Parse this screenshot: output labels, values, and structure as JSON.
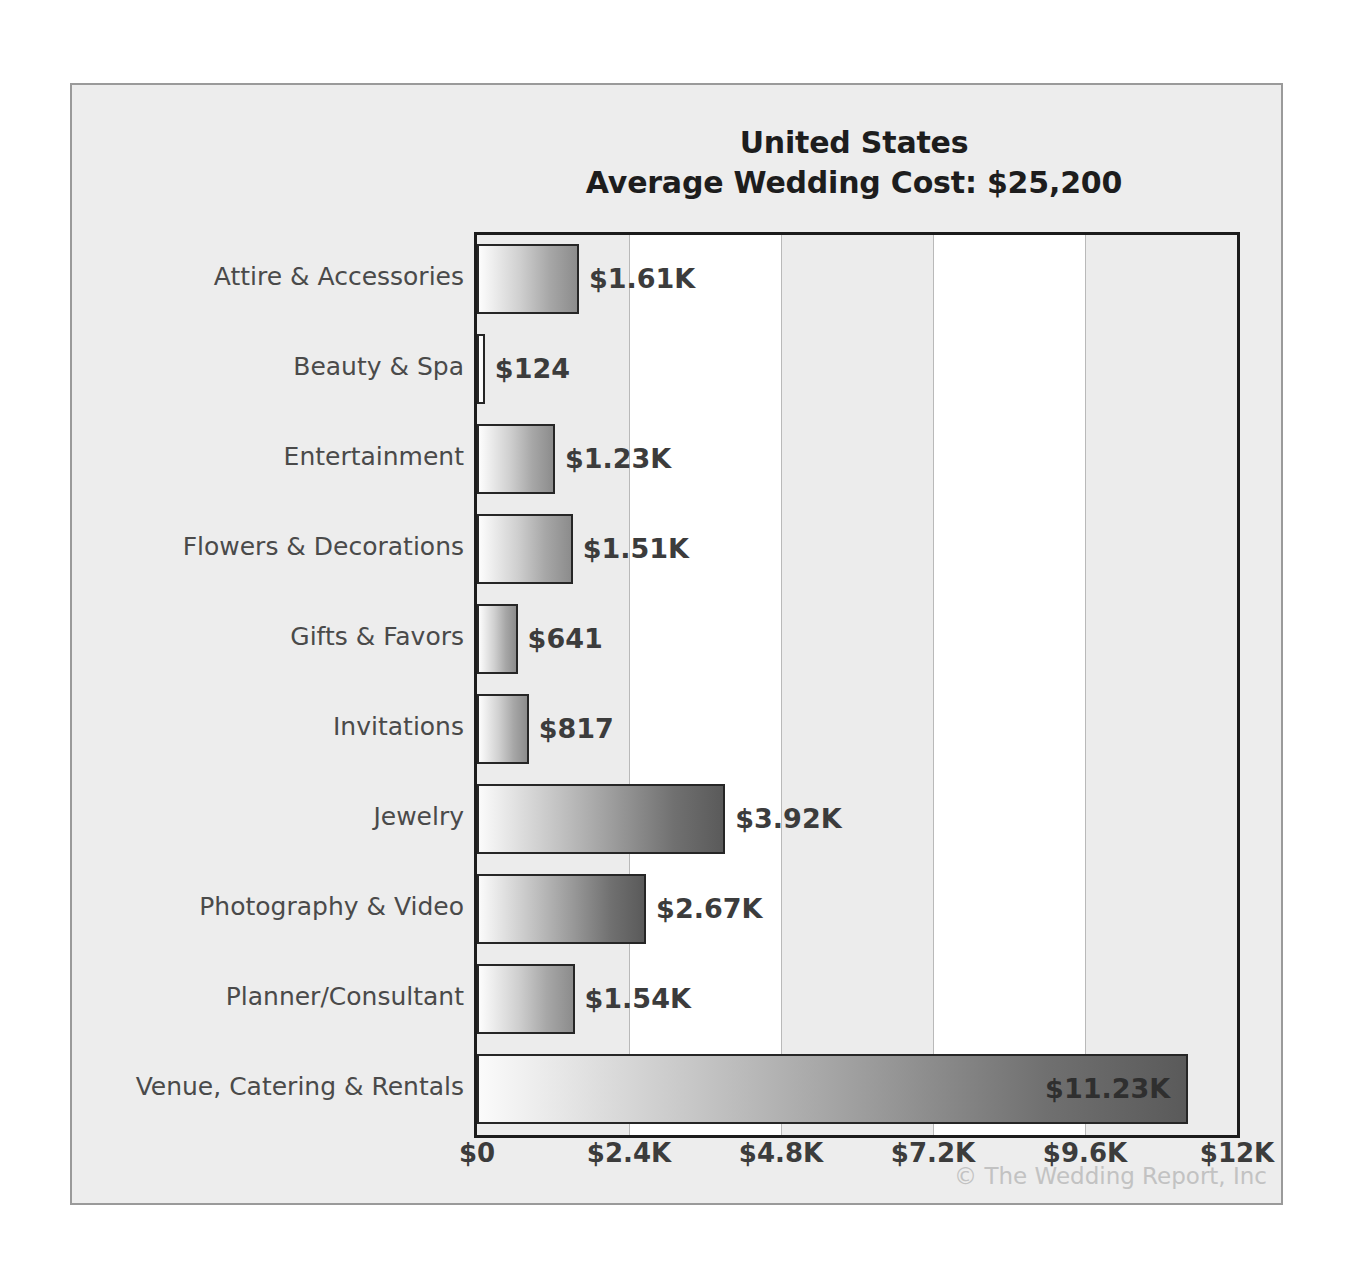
{
  "chart_data": {
    "type": "bar",
    "orientation": "horizontal",
    "title": "United States",
    "subtitle": "Average Wedding Cost: $25,200",
    "xlabel": "",
    "ylabel": "",
    "xlim": [
      0,
      12000
    ],
    "grid": true,
    "legend": null,
    "categories": [
      "Attire & Accessories",
      "Beauty & Spa",
      "Entertainment",
      "Flowers & Decorations",
      "Gifts & Favors",
      "Invitations",
      "Jewelry",
      "Photography & Video",
      "Planner/Consultant",
      "Venue, Catering & Rentals"
    ],
    "values": [
      1610,
      124,
      1230,
      1510,
      641,
      817,
      3920,
      2670,
      1540,
      11230
    ],
    "value_labels": [
      "$1.61K",
      "$124",
      "$1.23K",
      "$1.51K",
      "$641",
      "$817",
      "$3.92K",
      "$2.67K",
      "$1.54K",
      "$11.23K"
    ],
    "label_placement": [
      "outside",
      "outside",
      "outside",
      "outside",
      "outside",
      "outside",
      "outside",
      "outside",
      "outside",
      "inside"
    ],
    "xticks": [
      0,
      2400,
      4800,
      7200,
      9600,
      12000
    ],
    "xtick_labels": [
      "$0",
      "$2.4K",
      "$4.8K",
      "$7.2K",
      "$9.6K",
      "$12K"
    ]
  },
  "credit": "© The Wedding Report, Inc",
  "colors": {
    "panel_background": "#ededed",
    "plot_background": "#ffffff",
    "band": "#ececec",
    "gridline": "#b9b9b9",
    "axis": "#1c1c1c",
    "bar_light": "#fdfdfd",
    "bar_dark": "#5a5a5a",
    "bar_border": "#262626",
    "label_text": "#4a4a4a",
    "value_text": "#3c3c3c",
    "title_text": "#1d1d1d",
    "credit_text": "#c2c2c2"
  }
}
